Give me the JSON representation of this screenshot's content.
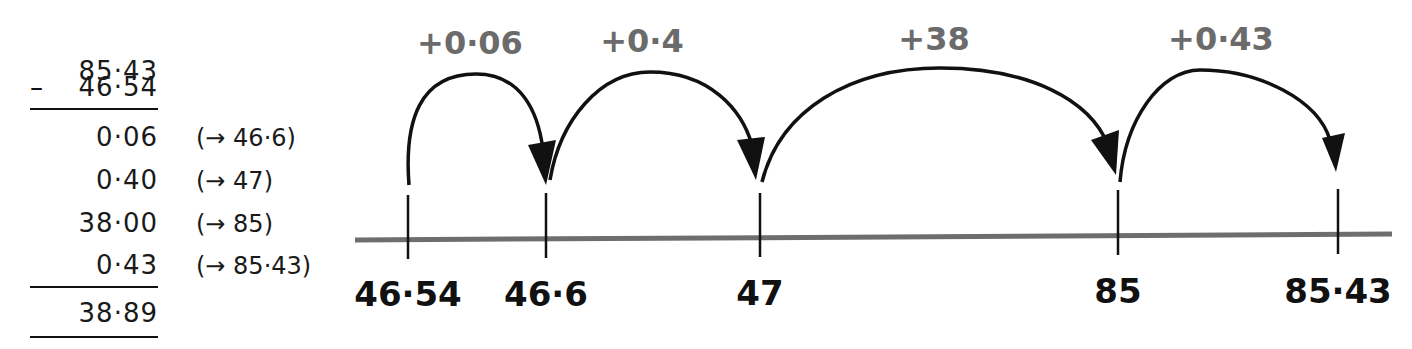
{
  "column_method": {
    "minuend": "85·43",
    "operator": "–",
    "subtrahend": "46·54",
    "steps": [
      {
        "amount": "0·06",
        "note": "(→ 46·6)"
      },
      {
        "amount": "0·40",
        "note": "(→ 47)"
      },
      {
        "amount": "38·00",
        "note": "(→ 85)"
      },
      {
        "amount": "0·43",
        "note": "(→ 85·43)"
      }
    ],
    "total": "38·89"
  },
  "number_line": {
    "line_color": "#6e6e6e",
    "label_color": "#6b6b6b",
    "ticks": [
      "46·54",
      "46·6",
      "47",
      "85",
      "85·43"
    ],
    "jumps": [
      {
        "label": "+0·06",
        "from": "46·54",
        "to": "46·6"
      },
      {
        "label": "+0·4",
        "from": "46·6",
        "to": "47"
      },
      {
        "label": "+38",
        "from": "47",
        "to": "85"
      },
      {
        "label": "+0·43",
        "from": "85",
        "to": "85·43"
      }
    ]
  }
}
